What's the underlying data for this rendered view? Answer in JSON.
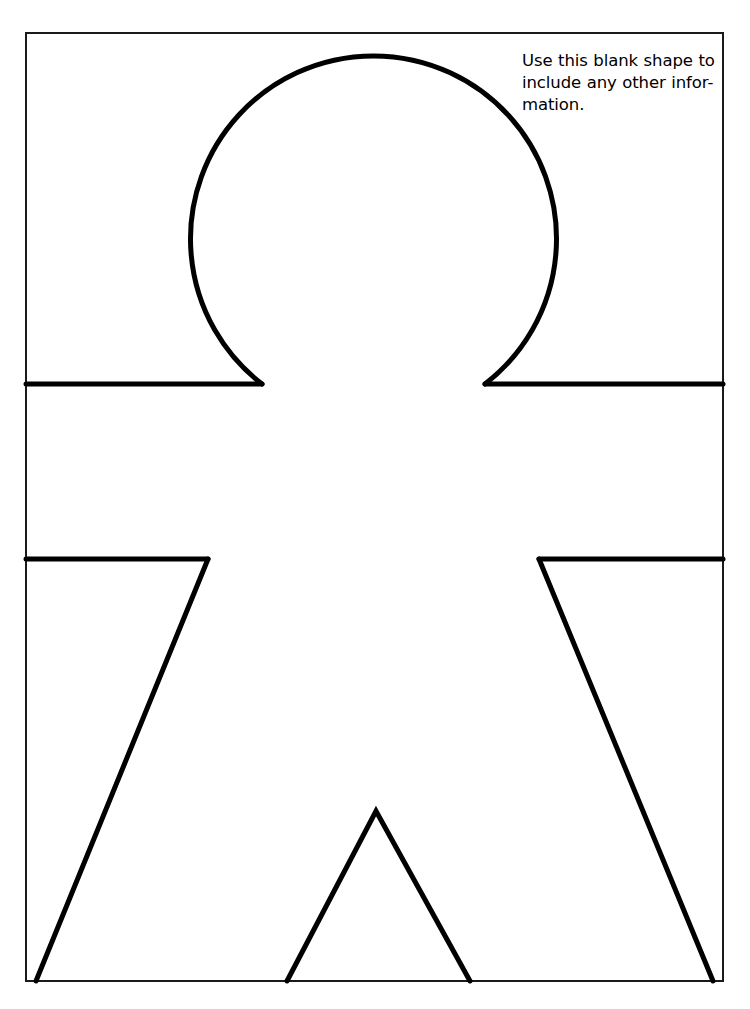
{
  "page": {
    "background_color": "#ffffff",
    "ink_color": "#000000",
    "width": 750,
    "height": 1009
  },
  "instruction": {
    "full_text": "Use this blank shape to include any other information.",
    "lines": [
      "Use this blank shape to",
      "include any other infor-",
      "mation."
    ]
  },
  "frame": {
    "label": "worksheet-border",
    "x": 26,
    "y": 33,
    "width": 697,
    "height": 948,
    "stroke_width": 2,
    "stroke_color": "#1a1a1a"
  },
  "figure": {
    "label": "blank-person-outline",
    "stroke_width": 5,
    "stroke_color": "#000000",
    "head": {
      "shape": "open-circle",
      "center_x": 375,
      "center_y": 228,
      "radius": 183,
      "gap_left_x": 262,
      "gap_right_x": 485,
      "gap_y": 384
    },
    "shoulders": {
      "y": 384,
      "left_from_x": 26,
      "left_to_x": 262,
      "right_from_x": 485,
      "right_to_x": 723
    },
    "armpits": {
      "y": 559,
      "left_from_x": 26,
      "left_to_x": 208,
      "right_from_x": 539,
      "right_to_x": 723
    },
    "sides": {
      "left_top_x": 208,
      "left_top_y": 559,
      "left_bottom_x": 36,
      "left_bottom_y": 981,
      "right_top_x": 539,
      "right_top_y": 559,
      "right_bottom_x": 713,
      "right_bottom_y": 981
    },
    "crotch": {
      "apex_x": 376,
      "apex_y": 811,
      "left_foot_x": 287,
      "left_foot_y": 981,
      "right_foot_x": 470,
      "right_foot_y": 981
    }
  }
}
